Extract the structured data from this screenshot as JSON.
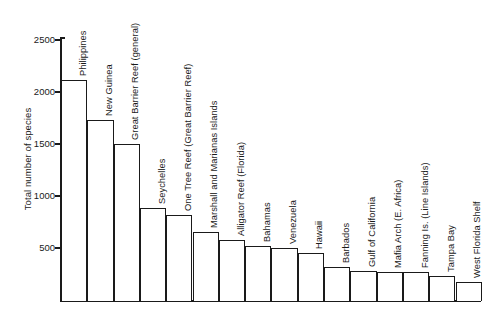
{
  "chart_data": {
    "type": "bar",
    "title": "",
    "xlabel": "",
    "ylabel": "Total number of species",
    "ylim": [
      0,
      2600
    ],
    "yticks": [
      500,
      1000,
      1500,
      2000,
      2500
    ],
    "ytick_labels": [
      "500",
      "1000",
      "1500",
      "2000",
      "2500"
    ],
    "grid": false,
    "legend": false,
    "orientation": "vertical",
    "bar_color": "#ffffff",
    "line_color": "#1a1a1a",
    "categories": [
      "Philippines",
      "New Guinea",
      "Great Barrier Reef (general)",
      "Seychelles",
      "One Tree Reef (Great Barrier Reef)",
      "Marshall and Marianas Islands",
      "Alligator Reef (Florida)",
      "Bahamas",
      "Venezuela",
      "Hawaii",
      "Barbados",
      "Gulf of California",
      "Mafia Arch (E. Africa)",
      "Fanning Is. (Line Islands)",
      "Tampa Bay",
      "West Florida Shelf"
    ],
    "values": [
      2120,
      1730,
      1500,
      880,
      820,
      650,
      580,
      520,
      500,
      450,
      320,
      280,
      270,
      270,
      230,
      170
    ]
  }
}
